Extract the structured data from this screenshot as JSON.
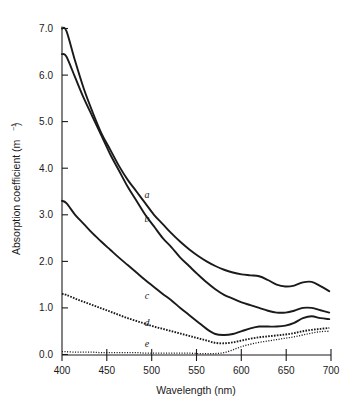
{
  "chart_data": {
    "type": "line",
    "title": "",
    "xlabel": "Wavelength (nm)",
    "ylabel_main": "Absorption coefficient (m",
    "ylabel_unit_sup": "−1",
    "ylabel_close": ")",
    "ylabel_full": "Absorption coefficient (m⁻¹)",
    "xlim": [
      395,
      702
    ],
    "ylim": [
      0.0,
      7.2
    ],
    "grid": false,
    "legend": "inline curve labels a-e placed next to each curve",
    "xticks": [
      400,
      450,
      500,
      550,
      600,
      650,
      700
    ],
    "xtick_labels": [
      "400",
      "450",
      "500",
      "550",
      "600",
      "650",
      "700"
    ],
    "yticks": [
      0.0,
      1.0,
      2.0,
      3.0,
      4.0,
      5.0,
      6.0,
      7.0
    ],
    "ytick_labels": [
      "0.0",
      "1.0",
      "2.0",
      "3.0",
      "4.0",
      "5.0",
      "6.0",
      "7.0"
    ],
    "x": [
      395,
      400,
      410,
      420,
      430,
      440,
      450,
      460,
      470,
      480,
      490,
      500,
      510,
      520,
      530,
      540,
      550,
      560,
      570,
      580,
      590,
      600,
      610,
      620,
      630,
      640,
      650,
      660,
      670,
      680,
      690,
      700
    ],
    "series": [
      {
        "name": "a",
        "label": "a",
        "style": "solid",
        "label_x": 492,
        "label_y": 3.35,
        "values": [
          7.0,
          6.95,
          6.3,
          5.7,
          5.2,
          4.75,
          4.4,
          4.05,
          3.75,
          3.5,
          3.25,
          3.0,
          2.8,
          2.6,
          2.42,
          2.26,
          2.12,
          2.0,
          1.9,
          1.82,
          1.76,
          1.72,
          1.7,
          1.68,
          1.6,
          1.5,
          1.46,
          1.48,
          1.55,
          1.56,
          1.47,
          1.36
        ]
      },
      {
        "name": "b",
        "label": "b",
        "style": "solid",
        "label_x": 492,
        "label_y": 2.85,
        "values": [
          6.45,
          6.4,
          5.95,
          5.5,
          5.1,
          4.7,
          4.3,
          3.95,
          3.6,
          3.3,
          3.0,
          2.75,
          2.5,
          2.3,
          2.08,
          1.9,
          1.72,
          1.55,
          1.4,
          1.28,
          1.2,
          1.12,
          1.06,
          1.0,
          0.94,
          0.9,
          0.9,
          0.94,
          1.0,
          1.0,
          0.95,
          0.9
        ]
      },
      {
        "name": "c",
        "label": "c",
        "style": "solid",
        "label_x": 492,
        "label_y": 1.2,
        "values": [
          3.3,
          3.25,
          3.0,
          2.8,
          2.6,
          2.42,
          2.25,
          2.08,
          1.92,
          1.76,
          1.6,
          1.45,
          1.3,
          1.16,
          1.0,
          0.85,
          0.7,
          0.55,
          0.44,
          0.42,
          0.44,
          0.5,
          0.56,
          0.6,
          0.6,
          0.6,
          0.62,
          0.68,
          0.78,
          0.82,
          0.78,
          0.76
        ]
      },
      {
        "name": "d",
        "label": "d",
        "style": "dashed",
        "label_x": 492,
        "label_y": 0.62,
        "values": [
          1.3,
          1.28,
          1.2,
          1.13,
          1.06,
          0.99,
          0.92,
          0.85,
          0.78,
          0.72,
          0.66,
          0.6,
          0.55,
          0.5,
          0.45,
          0.4,
          0.35,
          0.3,
          0.25,
          0.24,
          0.26,
          0.3,
          0.34,
          0.37,
          0.39,
          0.41,
          0.43,
          0.46,
          0.5,
          0.53,
          0.55,
          0.57
        ]
      },
      {
        "name": "e",
        "label": "e",
        "style": "dotted",
        "label_x": 492,
        "label_y": 0.16,
        "values": [
          0.06,
          0.06,
          0.05,
          0.05,
          0.05,
          0.04,
          0.04,
          0.04,
          0.04,
          0.04,
          0.03,
          0.03,
          0.03,
          0.03,
          0.03,
          0.03,
          0.02,
          0.02,
          0.02,
          0.04,
          0.1,
          0.17,
          0.22,
          0.26,
          0.29,
          0.32,
          0.35,
          0.38,
          0.42,
          0.46,
          0.49,
          0.5
        ]
      }
    ],
    "colors": {
      "axis": "#1a1a1a",
      "curve": "#1a1a1a",
      "background": "#ffffff"
    }
  }
}
